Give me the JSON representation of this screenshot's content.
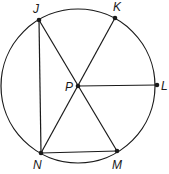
{
  "diagram": {
    "circle": {
      "center": "P",
      "cx": 78,
      "cy": 86,
      "r": 77
    },
    "points": [
      {
        "name": "J",
        "x": 39,
        "y": 20,
        "label_x": 33,
        "label_y": 13
      },
      {
        "name": "K",
        "x": 115,
        "y": 18,
        "label_x": 113,
        "label_y": 11
      },
      {
        "name": "P",
        "x": 78,
        "y": 86,
        "label_x": 65,
        "label_y": 91
      },
      {
        "name": "L",
        "x": 157,
        "y": 85,
        "label_x": 161,
        "label_y": 90
      },
      {
        "name": "N",
        "x": 41,
        "y": 153,
        "label_x": 33,
        "label_y": 169
      },
      {
        "name": "M",
        "x": 117,
        "y": 151,
        "label_x": 112,
        "label_y": 169
      }
    ],
    "segments": [
      {
        "from": "J",
        "to": "N"
      },
      {
        "from": "J",
        "to": "M"
      },
      {
        "from": "K",
        "to": "N"
      },
      {
        "from": "P",
        "to": "L"
      },
      {
        "from": "N",
        "to": "M"
      }
    ],
    "colors": {
      "stroke": "#1a1a1a",
      "background": "#ffffff"
    }
  }
}
